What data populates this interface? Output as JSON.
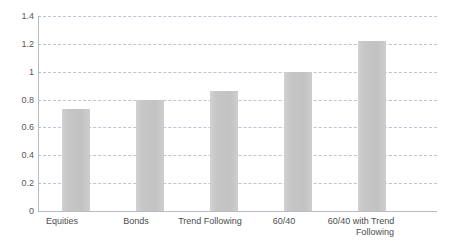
{
  "chart_data": {
    "type": "bar",
    "title": "",
    "subtitle": "",
    "xlabel": "",
    "ylabel": "",
    "categories": [
      "Equities",
      "Bonds",
      "Trend Following",
      "60/40",
      "60/40 with Trend Following"
    ],
    "values": [
      0.73,
      0.8,
      0.86,
      1.0,
      1.22
    ],
    "ylim": [
      0,
      1.4
    ],
    "ytick_labels": [
      "0",
      "0.2",
      "0.4",
      "0.6",
      "0.8",
      "1",
      "1.2",
      "1.4"
    ],
    "ytick_values": [
      0,
      0.2,
      0.4,
      0.6,
      0.8,
      1.0,
      1.2,
      1.4
    ],
    "grid": true,
    "grid_axis": "y",
    "grid_style": "dashed",
    "legend": false,
    "legend_position": "none",
    "bar_color": "#c6c6c6",
    "gridline_color": "#b9c4d4",
    "axis_color": "#b7bcc4",
    "tick_label_color": "#58585a",
    "category_label_color": "#4c4c4e",
    "background_color": "#ffffff",
    "series": [
      {
        "name": "",
        "values": [
          0.73,
          0.8,
          0.86,
          1.0,
          1.22
        ]
      }
    ],
    "category_label_lines": [
      [
        "Equities"
      ],
      [
        "Bonds"
      ],
      [
        "Trend Following"
      ],
      [
        "60/40"
      ],
      [
        "60/40 with Trend",
        "Following"
      ]
    ]
  }
}
